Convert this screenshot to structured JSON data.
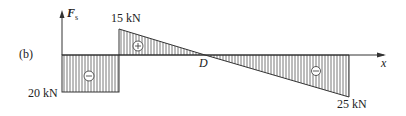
{
  "figure_label": "(b)",
  "axis": {
    "y_label": "F",
    "y_sub": "s",
    "x_label": "x"
  },
  "labels": {
    "top_value": "15 kN",
    "left_value": "20 kN",
    "right_value": "25 kN",
    "point_d": "D"
  },
  "signs": {
    "first": "−",
    "second": "+",
    "third": "−"
  },
  "colors": {
    "line": "#333333",
    "hatch": "#555555"
  }
}
